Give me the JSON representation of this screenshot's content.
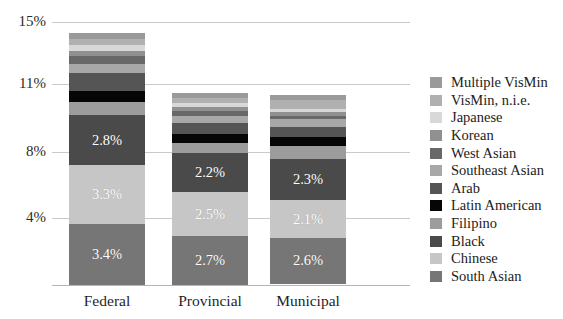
{
  "chart_data": {
    "type": "bar",
    "subtype": "stacked-bar",
    "title": "",
    "xlabel": "",
    "ylabel": "",
    "categories": [
      "Federal",
      "Provincial",
      "Municipal"
    ],
    "ytick_labels": [
      "15%",
      "11%",
      "8%",
      "4%"
    ],
    "ytick_values": [
      15,
      11,
      8,
      4
    ],
    "ylim": [
      0,
      15.6
    ],
    "grid": true,
    "legend_position": "right",
    "legend_order": "top-of-stack-first",
    "series": [
      {
        "name": "South Asian",
        "color": "#767676",
        "values": [
          3.4,
          2.7,
          2.6
        ],
        "labels": [
          "3.4%",
          "2.7%",
          "2.6%"
        ],
        "show_labels": true
      },
      {
        "name": "Chinese",
        "color": "#c6c6c6",
        "values": [
          3.3,
          2.5,
          2.1
        ],
        "labels": [
          "3.3%",
          "2.5%",
          "2.1%"
        ],
        "show_labels": true
      },
      {
        "name": "Black",
        "color": "#4a4a4a",
        "values": [
          2.8,
          2.2,
          2.3
        ],
        "labels": [
          "2.8%",
          "2.2%",
          "2.3%"
        ],
        "show_labels": true
      },
      {
        "name": "Filipino",
        "color": "#9c9c9c",
        "values": [
          0.75,
          0.55,
          0.72
        ],
        "labels": [
          "",
          "",
          ""
        ],
        "show_labels": false
      },
      {
        "name": "Latin American",
        "color": "#060606",
        "values": [
          0.62,
          0.46,
          0.5
        ],
        "labels": [
          "",
          "",
          ""
        ],
        "show_labels": false
      },
      {
        "name": "Arab",
        "color": "#555555",
        "values": [
          1.0,
          0.62,
          0.56
        ],
        "labels": [
          "",
          "",
          ""
        ],
        "show_labels": false
      },
      {
        "name": "Southeast Asian",
        "color": "#a8a8a8",
        "values": [
          0.52,
          0.4,
          0.45
        ],
        "labels": [
          "",
          "",
          ""
        ],
        "show_labels": false
      },
      {
        "name": "West Asian",
        "color": "#686868",
        "values": [
          0.4,
          0.28,
          0.2
        ],
        "labels": [
          "",
          "",
          ""
        ],
        "show_labels": false
      },
      {
        "name": "Korean",
        "color": "#909090",
        "values": [
          0.33,
          0.25,
          0.18
        ],
        "labels": [
          "",
          "",
          ""
        ],
        "show_labels": false
      },
      {
        "name": "Japanese",
        "color": "#d8d8d8",
        "values": [
          0.3,
          0.22,
          0.18
        ],
        "labels": [
          "",
          "",
          ""
        ],
        "show_labels": false
      },
      {
        "name": "VisMin, n.i.e.",
        "color": "#b0b0b0",
        "values": [
          0.35,
          0.3,
          0.5
        ],
        "labels": [
          "",
          "",
          ""
        ],
        "show_labels": false
      },
      {
        "name": "Multiple VisMin",
        "color": "#9a9a9a",
        "values": [
          0.33,
          0.25,
          0.28
        ],
        "labels": [
          "",
          "",
          ""
        ],
        "show_labels": false
      }
    ],
    "totals": [
      14.1,
      10.74,
      10.62
    ],
    "legend": [
      {
        "label": "Multiple VisMin",
        "color": "#9a9a9a"
      },
      {
        "label": "VisMin, n.i.e.",
        "color": "#b0b0b0"
      },
      {
        "label": "Japanese",
        "color": "#d8d8d8"
      },
      {
        "label": "Korean",
        "color": "#909090"
      },
      {
        "label": "West Asian",
        "color": "#686868"
      },
      {
        "label": "Southeast Asian",
        "color": "#a8a8a8"
      },
      {
        "label": "Arab",
        "color": "#555555"
      },
      {
        "label": "Latin American",
        "color": "#060606"
      },
      {
        "label": "Filipino",
        "color": "#9c9c9c"
      },
      {
        "label": "Black",
        "color": "#4a4a4a"
      },
      {
        "label": "Chinese",
        "color": "#c6c6c6"
      },
      {
        "label": "South Asian",
        "color": "#767676"
      }
    ]
  },
  "axis": {
    "gridline_color": "#c9c9c9",
    "baseline_color": "#b4b4b4"
  },
  "geometry": {
    "plot_left": 52,
    "plot_right": 410,
    "baseline_y": 285,
    "bar_width": 76,
    "bar_x": [
      69,
      172,
      270
    ],
    "gridline_y": [
      22,
      84,
      152,
      218
    ],
    "bar_top_y": [
      33,
      81,
      88
    ]
  }
}
